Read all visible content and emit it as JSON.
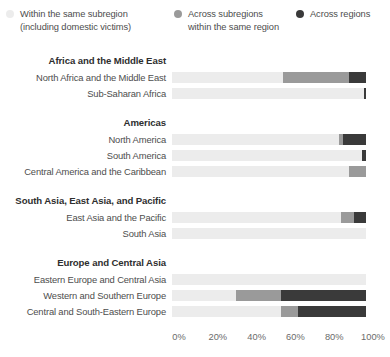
{
  "legend": {
    "position": "top",
    "items": [
      {
        "label": "Within the same subregion\n(including domestic victims)",
        "color": "#ececec",
        "icon": "legend-dot-within-subregion"
      },
      {
        "label": "Across subregions\nwithin the same region",
        "color": "#9a9a9a",
        "icon": "legend-dot-across-subregions"
      },
      {
        "label": "Across regions",
        "color": "#3a3a3a",
        "icon": "legend-dot-across-regions"
      }
    ]
  },
  "axis": {
    "ticks": [
      "0%",
      "20%",
      "40%",
      "60%",
      "80%",
      "100%"
    ],
    "tick_values": [
      0,
      20,
      40,
      60,
      80,
      100
    ]
  },
  "chart_data": {
    "type": "bar",
    "orientation": "horizontal",
    "stacked": true,
    "normalized": true,
    "title": "",
    "subtitle": "",
    "xlabel": "",
    "ylabel": "",
    "xlim": [
      0,
      100
    ],
    "grid": false,
    "legend_position": "top",
    "series": [
      {
        "name": "Within the same subregion (including domestic victims)",
        "color": "#ececec"
      },
      {
        "name": "Across subregions within the same region",
        "color": "#9a9a9a"
      },
      {
        "name": "Across regions",
        "color": "#3a3a3a"
      }
    ],
    "groups": [
      {
        "name": "Africa and the Middle East",
        "categories": [
          "North Africa and the Middle East",
          "Sub-Saharan Africa"
        ],
        "values": [
          [
            57,
            34,
            9
          ],
          [
            99,
            0,
            1
          ]
        ]
      },
      {
        "name": "Americas",
        "categories": [
          "North America",
          "South America",
          "Central America and the Caribbean"
        ],
        "values": [
          [
            86,
            2,
            12
          ],
          [
            98,
            0,
            2
          ],
          [
            91,
            9,
            0
          ]
        ]
      },
      {
        "name": "South Asia, East Asia, and Pacific",
        "categories": [
          "East Asia and the Pacific",
          "South Asia"
        ],
        "values": [
          [
            87,
            7,
            6
          ],
          [
            100,
            0,
            0
          ]
        ]
      },
      {
        "name": "Europe and Central Asia",
        "categories": [
          "Eastern Europe and Central Asia",
          "Western and Southern Europe",
          "Central and South-Eastern Europe"
        ],
        "values": [
          [
            100,
            0,
            0
          ],
          [
            33,
            23,
            44
          ],
          [
            56,
            9,
            35
          ]
        ]
      }
    ]
  }
}
